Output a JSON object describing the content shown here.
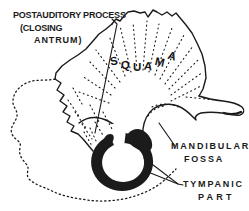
{
  "figure": {
    "type": "anatomical-line-drawing",
    "background_color": "#ffffff",
    "ink_color": "#1b1b1b",
    "labels": {
      "postauditory_process": {
        "line1": "POSTAUDITORY PROCESS",
        "line2": "(CLOSING",
        "line3": "ANTRUM)"
      },
      "squama": "SQUAMA",
      "mandibular_fossa": {
        "line1": "MANDIBULAR",
        "line2": "FOSSA"
      },
      "tympanic_part": {
        "line1": "TYMPANIC",
        "line2": "PART"
      }
    }
  }
}
